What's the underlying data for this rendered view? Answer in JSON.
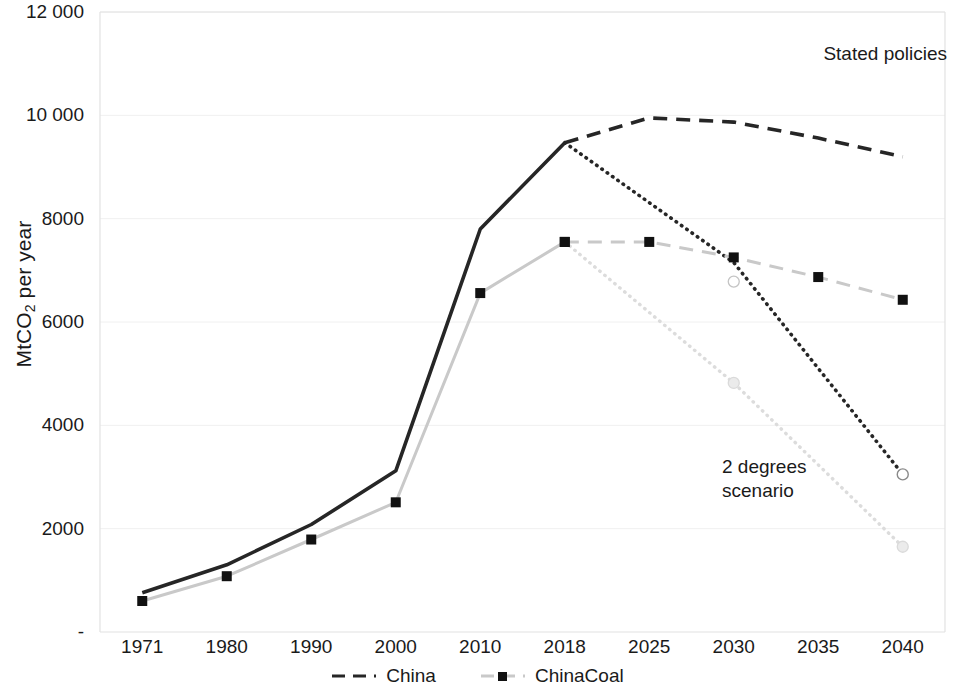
{
  "chart_data": {
    "type": "line",
    "title": "",
    "xlabel": "",
    "ylabel": "MtCO2 per year",
    "ylabel_prefix": "MtCO",
    "ylabel_sub": "2",
    "ylabel_suffix": " per year",
    "categories": [
      "1971",
      "1980",
      "1990",
      "2000",
      "2010",
      "2018",
      "2025",
      "2030",
      "2035",
      "2040"
    ],
    "ylim": [
      0,
      12000
    ],
    "yticks": [
      0,
      2000,
      4000,
      6000,
      8000,
      10000,
      12000
    ],
    "ytick_labels": [
      "-",
      "2000",
      "4000",
      "6000",
      "8000",
      "10 000",
      "12 000"
    ],
    "grid": "horizontal",
    "legend_position": "bottom-center",
    "series": [
      {
        "name": "China",
        "segment": "history",
        "style": "solid",
        "color": "#262626",
        "marker": "none",
        "x": [
          "1971",
          "1980",
          "1990",
          "2000",
          "2010",
          "2018"
        ],
        "values": [
          760,
          1300,
          2080,
          3120,
          7800,
          9470
        ]
      },
      {
        "name": "China",
        "segment": "stated-policies",
        "style": "dashed",
        "color": "#262626",
        "marker": "none",
        "x": [
          "2018",
          "2025",
          "2030",
          "2035",
          "2040"
        ],
        "values": [
          9470,
          9950,
          9870,
          9560,
          9200
        ]
      },
      {
        "name": "China",
        "segment": "2-degrees",
        "style": "dotted",
        "color": "#262626",
        "marker": "open-circle-end",
        "x": [
          "2018",
          "2030",
          "2040"
        ],
        "values": [
          9470,
          7150,
          3050
        ]
      },
      {
        "name": "ChinaCoal",
        "segment": "history",
        "style": "solid",
        "color": "#c9c9c9",
        "marker": "black-square",
        "x": [
          "1971",
          "1980",
          "1990",
          "2000",
          "2010",
          "2018"
        ],
        "values": [
          600,
          1080,
          1790,
          2510,
          6560,
          7550
        ]
      },
      {
        "name": "ChinaCoal",
        "segment": "stated-policies",
        "style": "dashed",
        "color": "#c9c9c9",
        "marker": "black-square",
        "x": [
          "2018",
          "2025",
          "2030",
          "2035",
          "2040"
        ],
        "values": [
          7550,
          7550,
          7250,
          6870,
          6430
        ]
      },
      {
        "name": "ChinaCoal",
        "segment": "2-degrees",
        "style": "dotted",
        "color": "#dcdcdc",
        "marker": "light-circle",
        "x": [
          "2018",
          "2030",
          "2040"
        ],
        "values": [
          7550,
          4820,
          1650
        ]
      }
    ],
    "annotations": [
      {
        "id": "stated-policies",
        "text": "Stated policies",
        "position": "top-right"
      },
      {
        "id": "two-degrees",
        "text": "2 degrees\nscenario",
        "position": "lower-right"
      }
    ],
    "legend": [
      {
        "label": "China",
        "style": "dashed",
        "color": "#262626",
        "marker": "none"
      },
      {
        "label": "ChinaCoal",
        "style": "dashed",
        "color": "#c9c9c9",
        "marker": "black-square"
      }
    ]
  }
}
